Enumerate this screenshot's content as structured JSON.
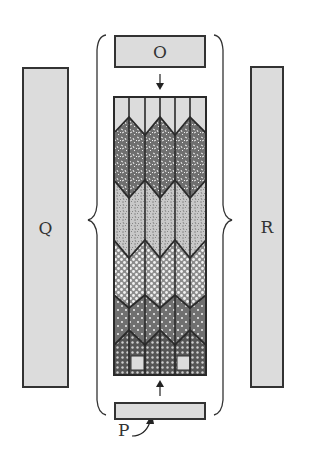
{
  "diagram": {
    "type": "schematic",
    "labels": {
      "left_bar": "Q",
      "right_bar": "R",
      "top_box": "O",
      "bottom_box_pointer": "P"
    },
    "column_stack": {
      "column_count": 6,
      "layers_top_to_bottom": [
        "plain light gray",
        "dark speckled",
        "light speckled",
        "light dotted",
        "dark dotted",
        "dark cross-hatched with light squares"
      ]
    },
    "arrows": [
      {
        "from": "O",
        "to": "column_stack",
        "direction": "down"
      },
      {
        "from": "P box",
        "to": "column_stack",
        "direction": "up"
      },
      {
        "from": "P label",
        "to": "P box",
        "direction": "curved up"
      }
    ],
    "brackets": [
      {
        "side": "left",
        "points_toward": "Q"
      },
      {
        "side": "right",
        "points_toward": "R"
      }
    ],
    "colors": {
      "fill_light": "#dcdcdc",
      "outline": "#333333",
      "dark_pattern": "#6a6a6a",
      "mid_pattern": "#9a9a9a"
    }
  }
}
